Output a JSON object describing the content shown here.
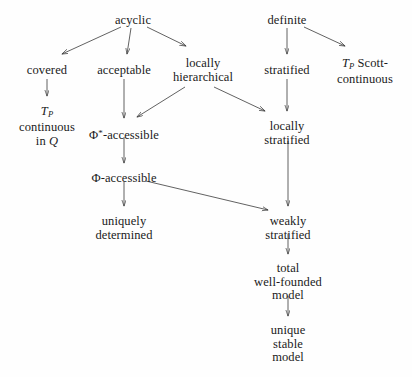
{
  "diagram": {
    "type": "directed-acyclic-graph",
    "background_color": "#fefefe",
    "edge_color": "#3a3a3a",
    "text_color": "#1a1a1a",
    "width": 412,
    "height": 377,
    "nodes": [
      {
        "id": "acyclic",
        "lines": [
          "acyclic"
        ],
        "x": 133,
        "y": 14
      },
      {
        "id": "definite",
        "lines": [
          "definite"
        ],
        "x": 287,
        "y": 14
      },
      {
        "id": "covered",
        "lines": [
          "covered"
        ],
        "x": 47,
        "y": 64
      },
      {
        "id": "acceptable",
        "lines": [
          "acceptable"
        ],
        "x": 124,
        "y": 64
      },
      {
        "id": "locally_hierarchical",
        "lines": [
          "locally",
          "hierarchical"
        ],
        "x": 203,
        "y": 57
      },
      {
        "id": "stratified",
        "lines": [
          "stratified"
        ],
        "x": 287,
        "y": 64
      },
      {
        "id": "tp_scott_continuous",
        "lines": [
          "T_P Scott-",
          "continuous"
        ],
        "x": 365,
        "y": 57
      },
      {
        "id": "tp_continuous_in_q",
        "lines": [
          "T_P",
          "continuous",
          "in Q"
        ],
        "x": 47,
        "y": 105
      },
      {
        "id": "phi_star_accessible",
        "lines": [
          "Φ*-accessible"
        ],
        "x": 124,
        "y": 127
      },
      {
        "id": "locally_stratified",
        "lines": [
          "locally",
          "stratified"
        ],
        "x": 287,
        "y": 120
      },
      {
        "id": "phi_accessible",
        "lines": [
          "Φ-accessible"
        ],
        "x": 124,
        "y": 172
      },
      {
        "id": "uniquely_determined",
        "lines": [
          "uniquely",
          "determined"
        ],
        "x": 124,
        "y": 215
      },
      {
        "id": "weakly_stratified",
        "lines": [
          "weakly",
          "stratified"
        ],
        "x": 288,
        "y": 215
      },
      {
        "id": "total_wf_model",
        "lines": [
          "total",
          "well-founded",
          "model"
        ],
        "x": 288,
        "y": 262
      },
      {
        "id": "unique_stable_model",
        "lines": [
          "unique",
          "stable",
          "model"
        ],
        "x": 288,
        "y": 324
      }
    ],
    "edges": [
      {
        "id": "acyclic-covered",
        "from": "acyclic",
        "to": "covered",
        "x1": 121,
        "y1": 27,
        "x2": 62,
        "y2": 54
      },
      {
        "id": "acyclic-acceptable",
        "from": "acyclic",
        "to": "acceptable",
        "x1": 131,
        "y1": 28,
        "x2": 127,
        "y2": 54
      },
      {
        "id": "acyclic-locally-hierarchical",
        "from": "acyclic",
        "to": "locally_hierarchical",
        "x1": 147,
        "y1": 27,
        "x2": 186,
        "y2": 46
      },
      {
        "id": "definite-stratified",
        "from": "definite",
        "to": "stratified",
        "x1": 287,
        "y1": 28,
        "x2": 287,
        "y2": 54
      },
      {
        "id": "definite-tp-scott",
        "from": "definite",
        "to": "tp_scott_continuous",
        "x1": 304,
        "y1": 27,
        "x2": 345,
        "y2": 46
      },
      {
        "id": "covered-tp-continuous",
        "from": "covered",
        "to": "tp_continuous_in_q",
        "x1": 47,
        "y1": 79,
        "x2": 47,
        "y2": 96
      },
      {
        "id": "acceptable-phistar",
        "from": "acceptable",
        "to": "phi_star_accessible",
        "x1": 124,
        "y1": 79,
        "x2": 124,
        "y2": 118
      },
      {
        "id": "lochier-phistar",
        "from": "locally_hierarchical",
        "to": "phi_star_accessible",
        "x1": 185,
        "y1": 87,
        "x2": 137,
        "y2": 117
      },
      {
        "id": "lochier-locstrat",
        "from": "locally_hierarchical",
        "to": "locally_stratified",
        "x1": 214,
        "y1": 87,
        "x2": 265,
        "y2": 111
      },
      {
        "id": "stratified-locstrat",
        "from": "stratified",
        "to": "locally_stratified",
        "x1": 287,
        "y1": 79,
        "x2": 287,
        "y2": 111
      },
      {
        "id": "phistar-phi",
        "from": "phi_star_accessible",
        "to": "phi_accessible",
        "x1": 124,
        "y1": 137,
        "x2": 124,
        "y2": 163
      },
      {
        "id": "phi-uniquely",
        "from": "phi_accessible",
        "to": "uniquely_determined",
        "x1": 124,
        "y1": 182,
        "x2": 124,
        "y2": 206
      },
      {
        "id": "phi-weakly",
        "from": "phi_accessible",
        "to": "weakly_stratified",
        "x1": 146,
        "y1": 181,
        "x2": 268,
        "y2": 210
      },
      {
        "id": "locstrat-weakly",
        "from": "locally_stratified",
        "to": "weakly_stratified",
        "x1": 288,
        "y1": 141,
        "x2": 288,
        "y2": 206
      },
      {
        "id": "weakly-total",
        "from": "weakly_stratified",
        "to": "total_wf_model",
        "x1": 288,
        "y1": 234,
        "x2": 288,
        "y2": 254
      },
      {
        "id": "total-unique",
        "from": "total_wf_model",
        "to": "unique_stable_model",
        "x1": 288,
        "y1": 296,
        "x2": 288,
        "y2": 316
      }
    ]
  }
}
